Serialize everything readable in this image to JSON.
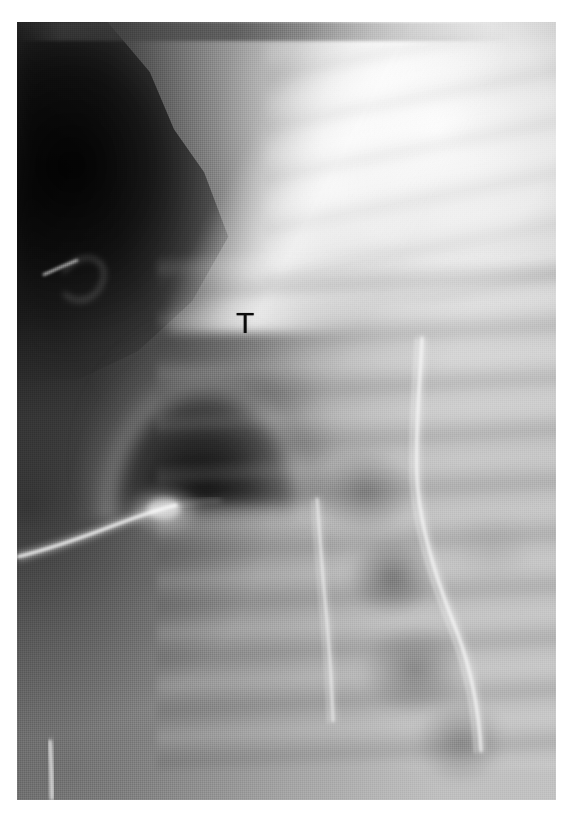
{
  "figure": {
    "kind": "radiograph",
    "modality": "X-ray",
    "view": "chest / upper abdomen",
    "background_color": "#ffffff",
    "plate": {
      "left": 17,
      "top": 22,
      "width": 539,
      "height": 778,
      "base_color": "#8e8e8e",
      "darkest": "#050505",
      "brightest": "#ffffff"
    }
  },
  "annotations": [
    {
      "id": "marker-t",
      "label": "T",
      "color": "#0b0b0b",
      "x": 236,
      "y": 308,
      "font_size_px": 30,
      "meaning": "radiologist letter marker"
    }
  ],
  "regions": [
    {
      "name": "dark-shoulder-soft-tissue",
      "position": "upper-left",
      "tone": "very dark"
    },
    {
      "name": "bright-lung-overexposure",
      "position": "upper-right",
      "tone": "very bright"
    },
    {
      "name": "dark-dome-gastric-bubble",
      "position": "mid-left",
      "tone": "dark"
    },
    {
      "name": "rib-band-striations",
      "position": "right / lower",
      "tone": "mid grey"
    },
    {
      "name": "vertebral-bodies",
      "position": "lower-right",
      "tone": "mottled grey"
    }
  ],
  "devices": [
    {
      "name": "enteric-tube-long-curved",
      "description": "long bright radiopaque tube curving down the right side"
    },
    {
      "name": "enteric-tube-second-line",
      "description": "thin bright line descending through the centre"
    },
    {
      "name": "ecg-lead-wire-diagonal",
      "description": "bright diagonal wire at mid-left with electrode"
    },
    {
      "name": "ecg-electrode-blob",
      "description": "bright rounded electrode opacity at mid-left"
    },
    {
      "name": "ecg-clip-upper-left",
      "description": "small bright clip in the dark upper-left field"
    },
    {
      "name": "wire-fragment-lower-left",
      "description": "short vertical bright wire near bottom-left"
    }
  ]
}
